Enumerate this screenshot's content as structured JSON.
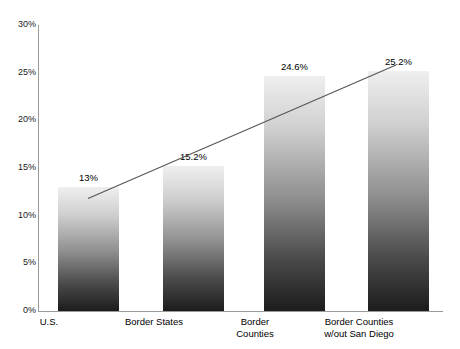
{
  "chart_data": {
    "type": "bar",
    "title": "",
    "xlabel": "",
    "ylabel": "",
    "categories": [
      "U.S.",
      "Border States",
      "Border\nCounties",
      "Border Counties\nw/out San Diego"
    ],
    "category_lines": [
      [
        "U.S."
      ],
      [
        "Border States"
      ],
      [
        "Border",
        "Counties"
      ],
      [
        "Border Counties",
        "w/out San Diego"
      ]
    ],
    "values": [
      13,
      15.2,
      24.6,
      25.2
    ],
    "value_labels": [
      "13%",
      "15.2%",
      "24.6%",
      "25.2%"
    ],
    "ylim": [
      0,
      30
    ],
    "y_ticks": [
      0,
      5,
      10,
      15,
      20,
      25,
      30
    ],
    "y_tick_labels": [
      "0%",
      "5%",
      "10%",
      "15%",
      "20%",
      "25%",
      "30%"
    ],
    "grid": false,
    "legend": "none",
    "annotations": [
      {
        "name": "trend-line",
        "type": "line",
        "from_value": 11.8,
        "to_value": 25.8,
        "description": "Straight rising trend line drawn across the bars from the first bar to the last bar"
      }
    ],
    "colors": {
      "bar_gradient_top": "#efefef",
      "bar_gradient_bottom": "#1c1c1c",
      "axis": "#9a9a9a",
      "text": "#000000",
      "trend_line": "#555555",
      "background": "#ffffff"
    }
  }
}
